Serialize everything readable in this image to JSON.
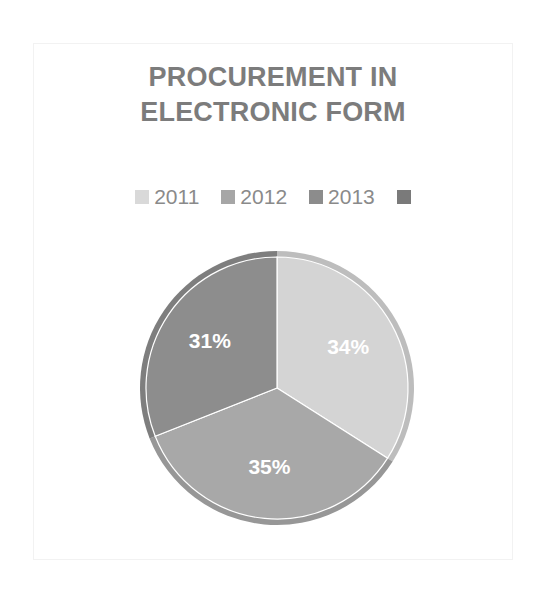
{
  "figure": {
    "title": "PROCUREMENT IN\nELECTRONIC FORM",
    "title_color": "#7c7c7c",
    "background_color": "#ffffff",
    "frame_color": "#f2f2f2"
  },
  "legend": {
    "position": "top",
    "items": [
      {
        "label": "2011",
        "color": "#d9d9d9"
      },
      {
        "label": "2012",
        "color": "#a6a6a6"
      },
      {
        "label": "2013",
        "color": "#8c8c8c"
      },
      {
        "label": "",
        "color": "#7a7a7a"
      }
    ]
  },
  "chart_data": {
    "type": "pie",
    "title": "PROCUREMENT IN ELECTRONIC FORM",
    "xlabel": "",
    "ylabel": "",
    "legend_position": "top",
    "grid": false,
    "categories": [
      "2011",
      "2012",
      "2013"
    ],
    "values": [
      34,
      35,
      31
    ],
    "value_unit": "%",
    "data_labels": [
      "34%",
      "35%",
      "31%"
    ],
    "colors": [
      "#d4d4d4",
      "#a8a8a8",
      "#8d8d8d"
    ],
    "start_angle_deg": 0,
    "direction": "clockwise",
    "slices": [
      {
        "name": "2011",
        "value": 34,
        "label": "34%",
        "color": "#d4d4d4",
        "rim_color": "#bdbdbd"
      },
      {
        "name": "2012",
        "value": 35,
        "label": "35%",
        "color": "#a8a8a8",
        "rim_color": "#979797"
      },
      {
        "name": "2013",
        "value": 31,
        "label": "31%",
        "color": "#8d8d8d",
        "rim_color": "#7e7e7e"
      }
    ],
    "label_color": "#ffffff"
  }
}
